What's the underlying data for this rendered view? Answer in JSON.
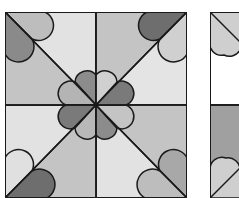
{
  "figure": {
    "colors": {
      "light": "#e2e2e2",
      "mid_light": "#c8c8c8",
      "mid": "#b4b4b4",
      "dark": "#8a8a8a",
      "darker": "#6e6e6e",
      "outline": "#1a1a1a",
      "background": "#ffffff"
    },
    "main_block": {
      "x": 5,
      "y": 12,
      "size": 182
    },
    "partial_block": {
      "x": 210,
      "y": 12
    }
  }
}
